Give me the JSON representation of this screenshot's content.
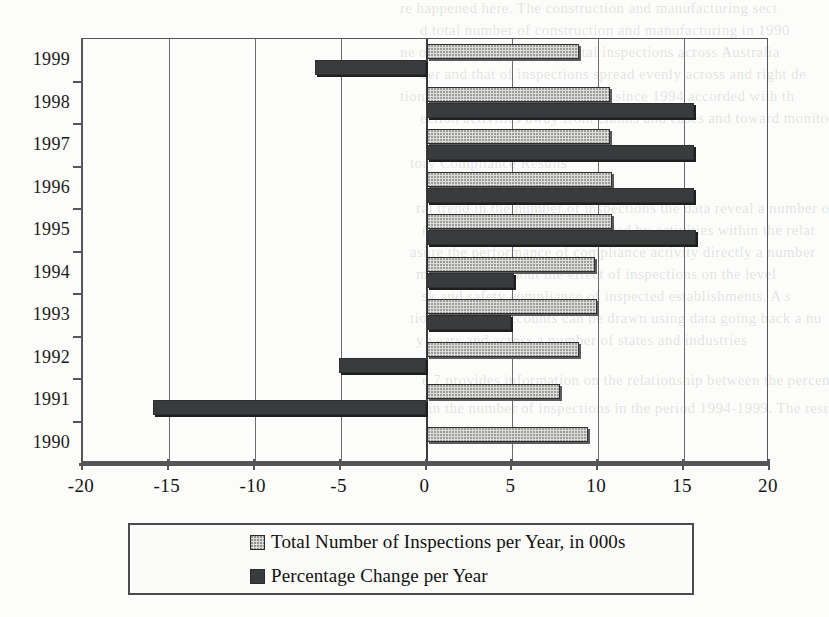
{
  "chart_data": {
    "type": "bar",
    "orientation": "horizontal",
    "title": "",
    "xlabel": "",
    "ylabel": "",
    "xlim": [
      -20,
      20
    ],
    "xticks": [
      -20,
      -15,
      -10,
      -5,
      0,
      5,
      10,
      15,
      20
    ],
    "xtick_labels": [
      "-20",
      "-15",
      "-10",
      "-5",
      "0",
      "5",
      "10",
      "15",
      "20"
    ],
    "grid": "vertical",
    "legend_position": "below",
    "categories": [
      "1999",
      "1998",
      "1997",
      "1996",
      "1995",
      "1994",
      "1993",
      "1992",
      "1991",
      "1990"
    ],
    "series": [
      {
        "name": "Total Number of Inspections per Year, in 000s",
        "color": "#dedcd8",
        "pattern": "dotted-fill",
        "values": [
          8.9,
          10.7,
          10.7,
          10.8,
          10.8,
          9.8,
          9.9,
          8.9,
          7.8,
          9.4
        ]
      },
      {
        "name": "Percentage Change per Year",
        "color": "#3a3b3d",
        "pattern": "solid-fill",
        "values": [
          -6.5,
          15.6,
          15.6,
          15.6,
          15.7,
          5.1,
          4.9,
          -5.1,
          -15.9,
          null
        ]
      }
    ]
  },
  "legend": {
    "items": [
      {
        "label": "Total Number of Inspections per Year, in 000s",
        "swatch": "light"
      },
      {
        "label": "Percentage Change per Year",
        "swatch": "dark"
      }
    ]
  },
  "background_text": {
    "lines": [
      "re happened here.  The construction and manufacturing sect",
      "d total number of construction and manufacturing in 1990",
      "ne of the increase in 1990 total inspections across Australia",
      "ber and that of inspections spread evenly across and right de",
      "tion in the number of inspections since 1994 accorded with th",
      "ection activities away from claims and cases and toward monito",
      "tory Compliance Results",
      "ral trend in the number of inspections the data reveal a number o",
      "nt levels of compliance achieved by activities within the relat",
      "asure the performance of compliance activity directly a number",
      "may be made about the effect of inspections on the level",
      "sk and safety compliance of inspected establishments. A s",
      "tions on these accounts can be drawn using data going back a nu",
      "y years and across a number of states and industries",
      "e 7 provides information on the relationship between the percenta",
      "ns in the number of inspections in the period 1994-1999.  The resul"
    ]
  }
}
